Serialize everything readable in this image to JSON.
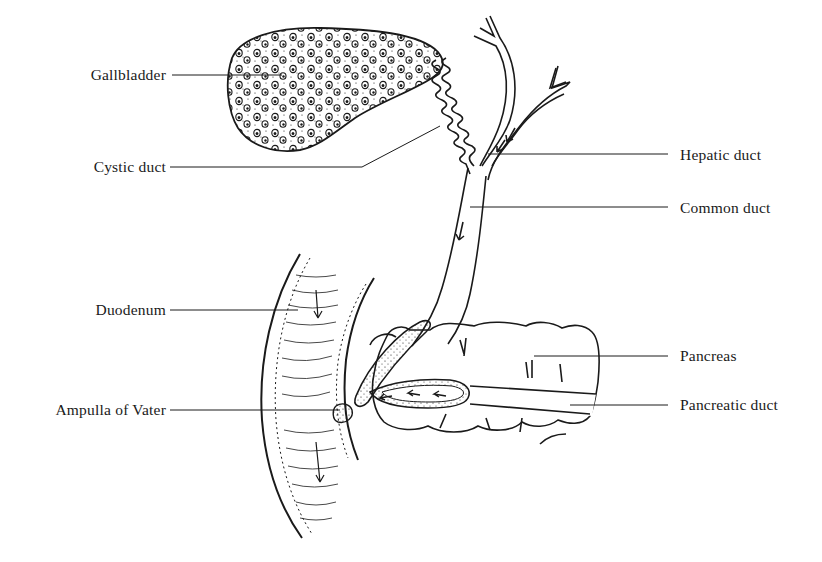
{
  "diagram": {
    "colors": {
      "ink": "#1a1a1a",
      "background": "#ffffff"
    },
    "labels": [
      {
        "id": "gallbladder",
        "text": "Gallbladder",
        "side": "left"
      },
      {
        "id": "cystic-duct",
        "text": "Cystic duct",
        "side": "left"
      },
      {
        "id": "hepatic-duct",
        "text": "Hepatic duct",
        "side": "right"
      },
      {
        "id": "common-duct",
        "text": "Common duct",
        "side": "right"
      },
      {
        "id": "duodenum",
        "text": "Duodenum",
        "side": "left"
      },
      {
        "id": "pancreas",
        "text": "Pancreas",
        "side": "right"
      },
      {
        "id": "ampulla-of-vater",
        "text": "Ampulla of Vater",
        "side": "left"
      },
      {
        "id": "pancreatic-duct",
        "text": "Pancreatic duct",
        "side": "right"
      }
    ]
  }
}
